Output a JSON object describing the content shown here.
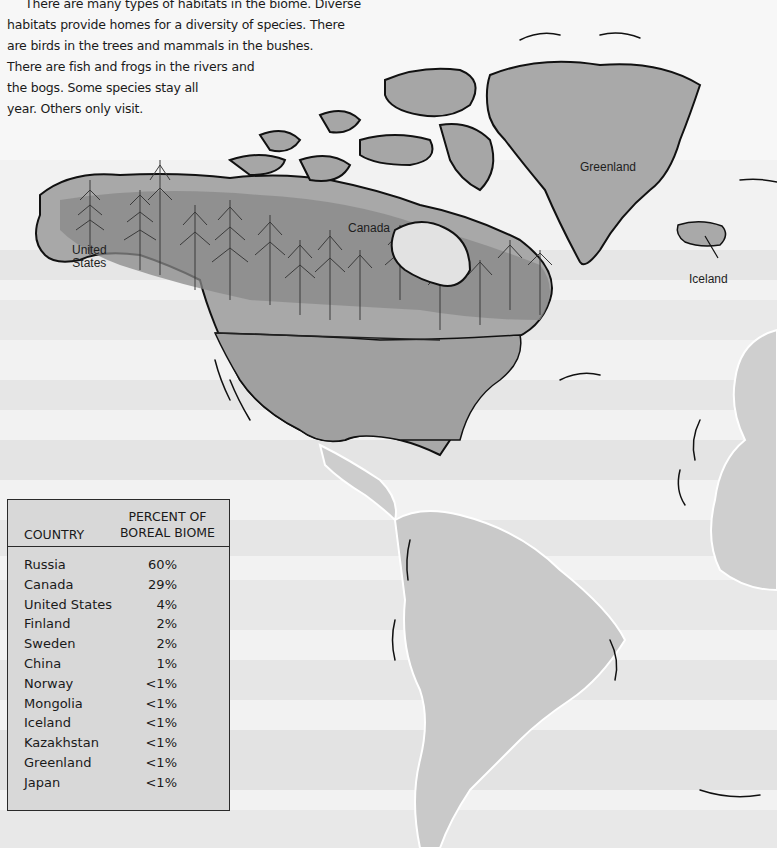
{
  "intro": {
    "lines": [
      "There are many types of habitats in the biome. Diverse",
      "habitats provide homes for a diversity of species. There",
      "are birds in the trees and mammals in the bushes.",
      "There are fish and frogs in the rivers and",
      "the bogs. Some species stay all",
      "year. Others only visit."
    ]
  },
  "map": {
    "labels": {
      "united_states": [
        "United",
        "States"
      ],
      "canada": "Canada",
      "greenland": "Greenland",
      "iceland": "Iceland"
    },
    "colors": {
      "land": "#a9a9a9",
      "land_light": "#c6c6c6",
      "forest": "#7d7d7d",
      "ocean": "#ececec",
      "coast": "#111111"
    }
  },
  "table": {
    "headers": {
      "country": "COUNTRY",
      "percent_line1": "PERCENT OF",
      "percent_line2": "BOREAL BIOME"
    },
    "rows": [
      {
        "country": "Russia",
        "percent": "60%"
      },
      {
        "country": "Canada",
        "percent": "29%"
      },
      {
        "country": "United States",
        "percent": "4%"
      },
      {
        "country": "Finland",
        "percent": "2%"
      },
      {
        "country": "Sweden",
        "percent": "2%"
      },
      {
        "country": "China",
        "percent": "1%"
      },
      {
        "country": "Norway",
        "percent": "<1%"
      },
      {
        "country": "Mongolia",
        "percent": "<1%"
      },
      {
        "country": "Iceland",
        "percent": "<1%"
      },
      {
        "country": "Kazakhstan",
        "percent": "<1%"
      },
      {
        "country": "Greenland",
        "percent": "<1%"
      },
      {
        "country": "Japan",
        "percent": "<1%"
      }
    ]
  }
}
